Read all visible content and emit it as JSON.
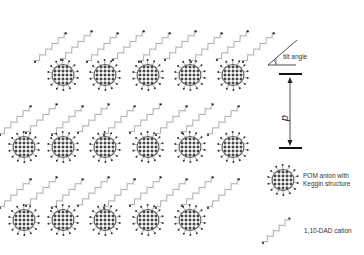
{
  "diagram": {
    "type": "crystal packing schematic",
    "legend": {
      "tilt_angle_label": "tilt angle",
      "spacing_label": "d",
      "pom_label_line1": "POM anion with",
      "pom_label_line2": "Keggin structure",
      "cation_label": "1,10-DAD cation"
    },
    "colors": {
      "pom": "#333333",
      "chain": "#8a8a8a",
      "bars": "#111111"
    },
    "pom_clusters": [
      {
        "x": 63,
        "y": 75
      },
      {
        "x": 105,
        "y": 75
      },
      {
        "x": 148,
        "y": 75
      },
      {
        "x": 190,
        "y": 75
      },
      {
        "x": 233,
        "y": 75
      },
      {
        "x": 24,
        "y": 147
      },
      {
        "x": 63,
        "y": 147
      },
      {
        "x": 105,
        "y": 147
      },
      {
        "x": 148,
        "y": 147
      },
      {
        "x": 190,
        "y": 147
      },
      {
        "x": 233,
        "y": 147
      },
      {
        "x": 24,
        "y": 220
      },
      {
        "x": 63,
        "y": 220
      },
      {
        "x": 105,
        "y": 220
      },
      {
        "x": 148,
        "y": 220
      },
      {
        "x": 190,
        "y": 220
      }
    ]
  }
}
